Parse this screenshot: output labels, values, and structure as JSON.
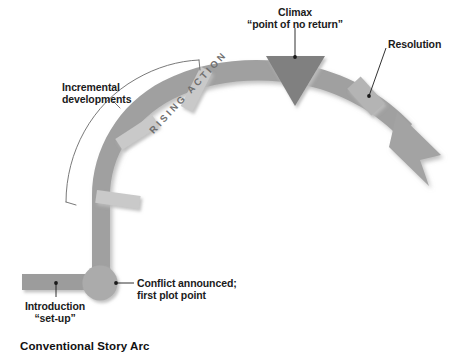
{
  "diagram": {
    "caption": "Conventional Story Arc",
    "labels": {
      "climax": "Climax\n“point of no return”",
      "resolution": "Resolution",
      "incremental": "Incremental\ndevelopments",
      "conflict": "Conflict announced;\nfirst plot point",
      "introduction": "Introduction\n“set-up”",
      "rising_action": "RISING ACTION"
    },
    "colors": {
      "arc": "#a0a0a0",
      "arc_dark": "#9a9a9a",
      "circle": "#ababab",
      "triangle": "#808080",
      "tick": "#c9c9c9",
      "bar": "#9c9c9c",
      "shadow": "#d9d9d9",
      "leader": "#1a1a1a",
      "bracket": "#6a6a6a",
      "text": "#1b1b1b",
      "rising_text": "#6f6f6f"
    },
    "stages": [
      {
        "name": "introduction",
        "order": 1,
        "label": "Introduction “set-up”",
        "shape": "horizontal-bar"
      },
      {
        "name": "first-plot-point",
        "order": 2,
        "label": "Conflict announced; first plot point",
        "shape": "circle"
      },
      {
        "name": "rising-action",
        "order": 3,
        "label": "RISING ACTION",
        "shape": "rising-arc",
        "tick_count": 3
      },
      {
        "name": "incremental-developments",
        "order": 4,
        "label": "Incremental developments",
        "shape": "bracket"
      },
      {
        "name": "climax",
        "order": 5,
        "label": "Climax “point of no return”",
        "shape": "down-triangle"
      },
      {
        "name": "resolution",
        "order": 6,
        "label": "Resolution",
        "shape": "arrow-head"
      }
    ]
  }
}
